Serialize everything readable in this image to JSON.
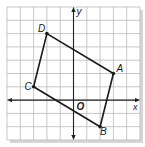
{
  "figure": {
    "axes": {
      "x_label": "x",
      "y_label": "y",
      "origin_label": "O"
    },
    "grid": {
      "x_min": -5,
      "x_max": 5,
      "y_min": -3,
      "y_max": 7,
      "cell_px": 13.3
    },
    "points": [
      {
        "label": "A",
        "x": 3,
        "y": 2
      },
      {
        "label": "B",
        "x": 2,
        "y": -2
      },
      {
        "label": "C",
        "x": -3,
        "y": 1
      },
      {
        "label": "D",
        "x": -2,
        "y": 5
      }
    ],
    "colors": {
      "grid": "#b9b9b9",
      "axis": "#222222",
      "shape": "#1a1a1a",
      "shadow": "#d6d6d6",
      "background": "#ffffff"
    }
  }
}
